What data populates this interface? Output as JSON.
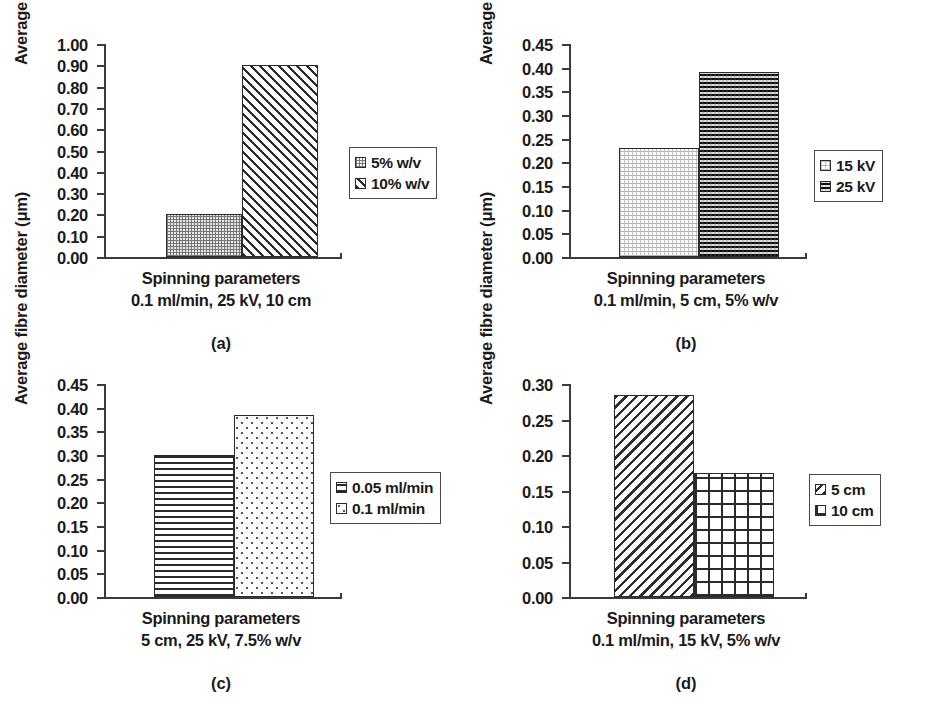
{
  "figure": {
    "background": "#ffffff",
    "axis_color": "#3a3a3a",
    "bar_outline": "#2b2b2b",
    "text_color": "#1a1a1a"
  },
  "panels": [
    {
      "id": "a",
      "letter": "(a)",
      "ylabel": "Average fibre diameter (μm)",
      "xlabel_line1": "Spinning parameters",
      "xlabel_line2": "0.1 ml/min, 25 kV, 10 cm",
      "ticks": [
        "0.00",
        "0.10",
        "0.20",
        "0.30",
        "0.40",
        "0.50",
        "0.60",
        "0.70",
        "0.80",
        "0.90",
        "1.00"
      ],
      "legend": [
        {
          "label": "5% w/v",
          "pattern": "checker-fine"
        },
        {
          "label": "10% w/v",
          "pattern": "diag-fwd"
        }
      ]
    },
    {
      "id": "b",
      "letter": "(b)",
      "ylabel": "Average fibre diameter (μm)",
      "xlabel_line1": "Spinning parameters",
      "xlabel_line2": "0.1 ml/min, 5 cm, 5% w/v",
      "ticks": [
        "0.00",
        "0.05",
        "0.10",
        "0.15",
        "0.20",
        "0.25",
        "0.30",
        "0.35",
        "0.40",
        "0.45"
      ],
      "legend": [
        {
          "label": "15 kV",
          "pattern": "dots-light"
        },
        {
          "label": "25 kV",
          "pattern": "checker-dark"
        }
      ]
    },
    {
      "id": "c",
      "letter": "(c)",
      "ylabel": "Average fibre diameter (μm)",
      "xlabel_line1": "Spinning parameters",
      "xlabel_line2": "5 cm, 25 kV, 7.5% w/v",
      "ticks": [
        "0.00",
        "0.05",
        "0.10",
        "0.15",
        "0.20",
        "0.25",
        "0.30",
        "0.35",
        "0.40",
        "0.45"
      ],
      "legend": [
        {
          "label": "0.05 ml/min",
          "pattern": "hlines"
        },
        {
          "label": "0.1 ml/min",
          "pattern": "dots-sparse"
        }
      ]
    },
    {
      "id": "d",
      "letter": "(d)",
      "ylabel": "Average fibre diameter (μm)",
      "xlabel_line1": "Spinning parameters",
      "xlabel_line2": "0.1 ml/min, 15 kV, 5% w/v",
      "ticks": [
        "0.00",
        "0.05",
        "0.10",
        "0.15",
        "0.20",
        "0.25",
        "0.30"
      ],
      "legend": [
        {
          "label": "5 cm",
          "pattern": "diag-back"
        },
        {
          "label": "10 cm",
          "pattern": "grid"
        }
      ]
    }
  ],
  "chart_data": [
    {
      "type": "bar",
      "panel": "a",
      "title": "",
      "xlabel": "Spinning parameters 0.1 ml/min, 25 kV, 10 cm",
      "ylabel": "Average fibre diameter (μm)",
      "ylim": [
        0.0,
        1.0
      ],
      "ytick_step": 0.1,
      "yticks": [
        0.0,
        0.1,
        0.2,
        0.3,
        0.4,
        0.5,
        0.6,
        0.7,
        0.8,
        0.9,
        1.0
      ],
      "grid": false,
      "legend_position": "right",
      "categories": [
        "5% w/v",
        "10% w/v"
      ],
      "values": [
        0.2,
        0.9
      ],
      "series": [
        {
          "name": "5% w/v",
          "values": [
            0.2
          ],
          "pattern": "checker-fine"
        },
        {
          "name": "10% w/v",
          "values": [
            0.9
          ],
          "pattern": "diag-fwd"
        }
      ]
    },
    {
      "type": "bar",
      "panel": "b",
      "title": "",
      "xlabel": "Spinning parameters 0.1 ml/min, 5 cm, 5% w/v",
      "ylabel": "Average fibre diameter (μm)",
      "ylim": [
        0.0,
        0.45
      ],
      "ytick_step": 0.05,
      "yticks": [
        0.0,
        0.05,
        0.1,
        0.15,
        0.2,
        0.25,
        0.3,
        0.35,
        0.4,
        0.45
      ],
      "grid": false,
      "legend_position": "right",
      "categories": [
        "15 kV",
        "25 kV"
      ],
      "values": [
        0.23,
        0.39
      ],
      "series": [
        {
          "name": "15 kV",
          "values": [
            0.23
          ],
          "pattern": "dots-light"
        },
        {
          "name": "25 kV",
          "values": [
            0.39
          ],
          "pattern": "checker-dark"
        }
      ]
    },
    {
      "type": "bar",
      "panel": "c",
      "title": "",
      "xlabel": "Spinning parameters 5 cm, 25 kV, 7.5% w/v",
      "ylabel": "Average fibre diameter (μm)",
      "ylim": [
        0.0,
        0.45
      ],
      "ytick_step": 0.05,
      "yticks": [
        0.0,
        0.05,
        0.1,
        0.15,
        0.2,
        0.25,
        0.3,
        0.35,
        0.4,
        0.45
      ],
      "grid": false,
      "legend_position": "right",
      "categories": [
        "0.05 ml/min",
        "0.1 ml/min"
      ],
      "values": [
        0.3,
        0.385
      ],
      "series": [
        {
          "name": "0.05 ml/min",
          "values": [
            0.3
          ],
          "pattern": "hlines"
        },
        {
          "name": "0.1 ml/min",
          "values": [
            0.385
          ],
          "pattern": "dots-sparse"
        }
      ]
    },
    {
      "type": "bar",
      "panel": "d",
      "title": "",
      "xlabel": "Spinning parameters 0.1 ml/min, 15 kV, 5% w/v",
      "ylabel": "Average fibre diameter (μm)",
      "ylim": [
        0.0,
        0.3
      ],
      "ytick_step": 0.05,
      "yticks": [
        0.0,
        0.05,
        0.1,
        0.15,
        0.2,
        0.25,
        0.3
      ],
      "grid": false,
      "legend_position": "right",
      "categories": [
        "5 cm",
        "10 cm"
      ],
      "values": [
        0.285,
        0.175
      ],
      "series": [
        {
          "name": "5 cm",
          "values": [
            0.285
          ],
          "pattern": "diag-back"
        },
        {
          "name": "10 cm",
          "values": [
            0.175
          ],
          "pattern": "grid"
        }
      ]
    }
  ]
}
